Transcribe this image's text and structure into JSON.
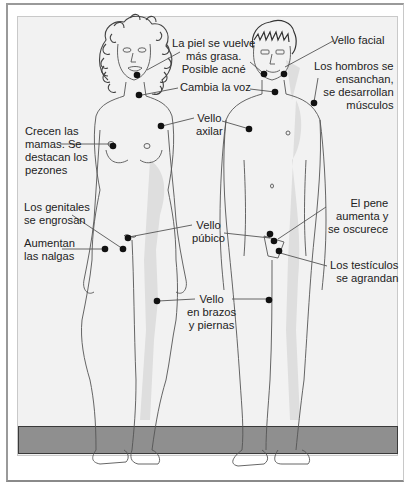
{
  "figure": {
    "colors": {
      "background": "#f2f2f2",
      "floor": "#8f8f8f",
      "skin_shadow": "#dcdcdc",
      "marker": "#111111",
      "line": "#555555"
    },
    "female_labels": {
      "skin": "La piel se vuelve\nmás grasa.\nPosible acné",
      "voice": "Cambia la voz",
      "axillary": "Vello\naxilar",
      "breasts": "Crecen las\nmamas. Se\ndestacan los\npezones",
      "genitals": "Los genitales\nse engrosan",
      "buttocks": "Aumentan\nlas nalgas",
      "pubic": "Vello\npúbico",
      "limbs": "Vello\nen brazos\ny piernas"
    },
    "male_labels": {
      "facial_hair": "Vello facial",
      "shoulders": "Los hombros se\nensanchan,\nse desarrollan\nmúsculos",
      "penis": "El pene\naumenta y\nse oscurece",
      "testicles": "Los testículos\nse agrandan"
    }
  }
}
